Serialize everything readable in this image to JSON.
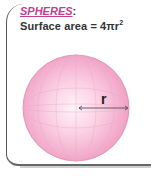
{
  "heading": {
    "title": "SPHERES",
    "colon": ":",
    "formula_prefix": "Surface area = 4πr",
    "formula_exponent": "2"
  },
  "diagram": {
    "shape": "sphere",
    "radius_label": "r",
    "colors": {
      "sphere_fill": "#f3a6c8",
      "sphere_highlight": "#fde8f1",
      "sphere_outline": "#d97aa6",
      "title_color": "#c2408f",
      "arrow_color": "#444444"
    }
  }
}
